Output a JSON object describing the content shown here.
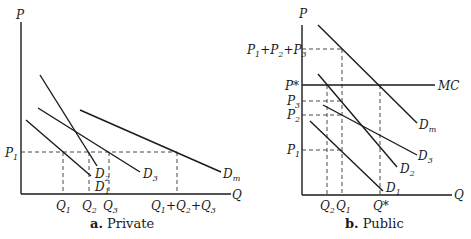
{
  "panels": {
    "private": {
      "caption_letter": "a.",
      "caption_text": "Private",
      "y_axis_label": "P",
      "x_axis_label": "Q",
      "price_labels": {
        "p1": "P",
        "p1_sub": "1"
      },
      "curves": {
        "d1": {
          "base": "D",
          "sub": "1"
        },
        "d2": {
          "base": "D",
          "sub": "2"
        },
        "d3": {
          "base": "D",
          "sub": "3"
        },
        "dm": {
          "base": "D",
          "sub": "m"
        }
      },
      "quantity_labels": {
        "q1": {
          "base": "Q",
          "sub": "1"
        },
        "q2": {
          "base": "Q",
          "sub": "2"
        },
        "q3": {
          "base": "Q",
          "sub": "3"
        },
        "qsum": {
          "a": "Q",
          "a_sub": "1",
          "plus1": "+",
          "b": "Q",
          "b_sub": "2",
          "plus2": "+",
          "c": "Q",
          "c_sub": "3"
        }
      }
    },
    "public": {
      "caption_letter": "b.",
      "caption_text": "Public",
      "y_axis_label": "P",
      "x_axis_label": "Q",
      "price_labels": {
        "psum": {
          "a": "P",
          "a_sub": "1",
          "plus1": "+",
          "b": "P",
          "b_sub": "2",
          "plus2": "+",
          "c": "P",
          "c_sub": "3"
        },
        "pstar": "P*",
        "p3": {
          "base": "P",
          "sub": "3"
        },
        "p2": {
          "base": "P",
          "sub": "2"
        },
        "p1": {
          "base": "P",
          "sub": "1"
        }
      },
      "curves": {
        "mc": "MC",
        "d1": {
          "base": "D",
          "sub": "1"
        },
        "d2": {
          "base": "D",
          "sub": "2"
        },
        "d3": {
          "base": "D",
          "sub": "3"
        },
        "dm": {
          "base": "D",
          "sub": "m"
        }
      },
      "quantity_labels": {
        "q2": {
          "base": "Q",
          "sub": "2"
        },
        "q1": {
          "base": "Q",
          "sub": "1"
        },
        "qstar": "Q*"
      }
    }
  }
}
